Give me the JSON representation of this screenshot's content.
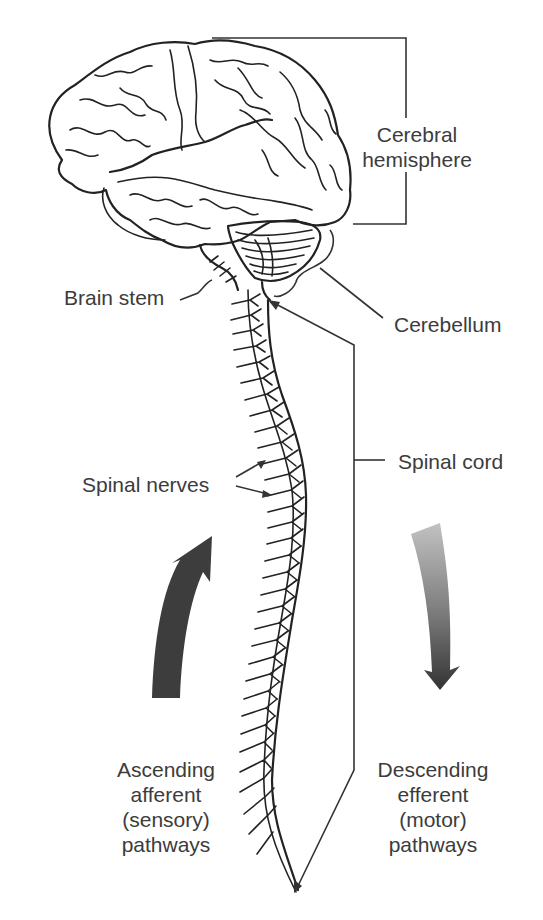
{
  "figure": {
    "colors": {
      "background": "#ffffff",
      "line_art": "#222222",
      "label_text": "#3c3c3c",
      "ascending_arrow": "#3d3d3d",
      "descending_arrow_top": "#b8b8b8",
      "descending_arrow_bottom": "#3a3a3a"
    }
  },
  "labels": {
    "cerebral_hemisphere": {
      "line1": "Cerebral",
      "line2": "hemisphere"
    },
    "brain_stem": "Brain stem",
    "cerebellum": "Cerebellum",
    "spinal_cord": "Spinal cord",
    "spinal_nerves": "Spinal nerves",
    "ascending": {
      "line1": "Ascending",
      "line2": "afferent",
      "line3": "(sensory)",
      "line4": "pathways"
    },
    "descending": {
      "line1": "Descending",
      "line2": "efferent",
      "line3": "(motor)",
      "line4": "pathways"
    }
  },
  "arrows": {
    "ascending": {
      "direction": "up",
      "icon": "arrow-up-icon"
    },
    "descending": {
      "direction": "down",
      "icon": "arrow-down-icon"
    }
  }
}
